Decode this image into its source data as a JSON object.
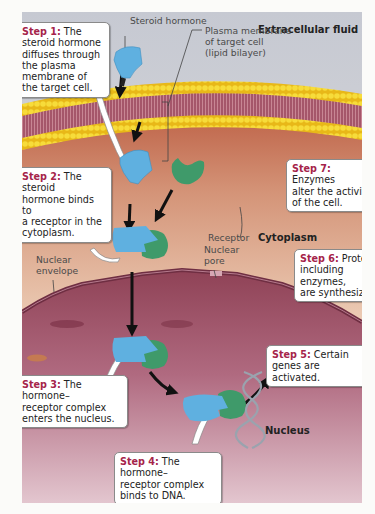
{
  "figure": {
    "regions": {
      "extracellular": "Extracellular fluid",
      "cytoplasm": "Cytoplasm",
      "nucleus": "Nucleus"
    },
    "labels": {
      "steroid_hormone": "Steroid hormone",
      "plasma_membrane_1": "Plasma membrane",
      "plasma_membrane_2": "of target cell",
      "plasma_membrane_3": "(lipid bilayer)",
      "receptor": "Receptor",
      "nuclear_envelope_1": "Nuclear",
      "nuclear_envelope_2": "envelope",
      "nuclear_pore_1": "Nuclear",
      "nuclear_pore_2": "pore"
    },
    "steps": [
      {
        "title": "Step 1:",
        "lines": [
          " The",
          "steroid hormone",
          "diffuses through",
          "the plasma",
          "membrane of",
          "the target cell."
        ]
      },
      {
        "title": "Step 2:",
        "lines": [
          " The steroid",
          "hormone binds to",
          "a receptor in the",
          "cytoplasm."
        ]
      },
      {
        "title": "Step 3:",
        "lines": [
          " The hormone–",
          "receptor complex",
          "enters the nucleus."
        ]
      },
      {
        "title": "Step 4:",
        "lines": [
          " The hormone–",
          "receptor complex",
          "binds to DNA."
        ]
      },
      {
        "title": "Step 5:",
        "lines": [
          " Certain",
          "genes are activated."
        ]
      },
      {
        "title": "Step 6:",
        "lines": [
          " Proteins,",
          "including enzymes,",
          "are synthesized."
        ]
      },
      {
        "title": "Step 7:",
        "lines": [
          " Enzymes",
          "alter the activity",
          "of the cell."
        ]
      }
    ],
    "colors": {
      "step_title": "#a5244a",
      "hormone": "#5fb0e0",
      "receptor": "#3f9a6a",
      "membrane_head": "#f2cf2a",
      "membrane_tail": "#9c4a5a",
      "cytoplasm": "#d7a486",
      "nucleus": "#9c5068",
      "extracellular": "#c9ccd4"
    }
  }
}
